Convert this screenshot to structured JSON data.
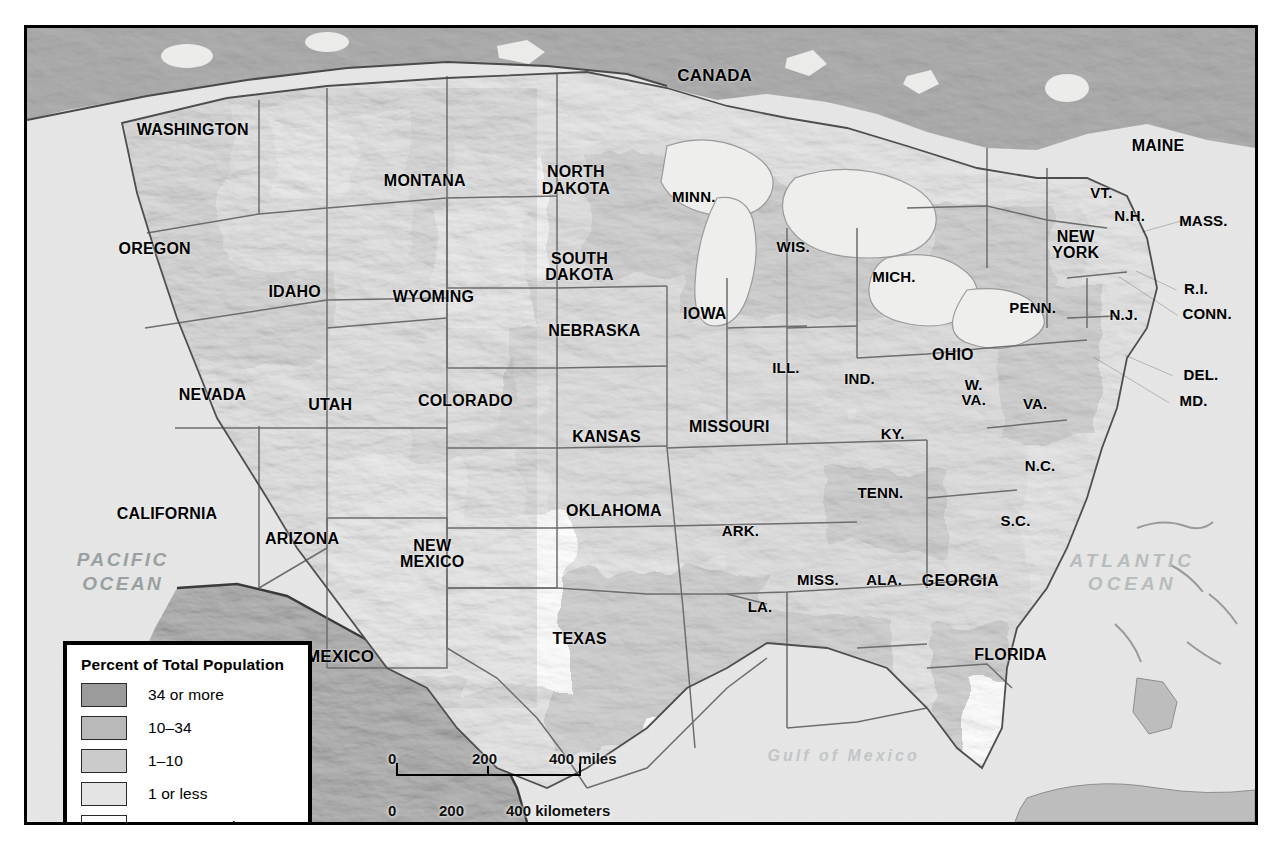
{
  "map": {
    "title": "Percent of Total Population",
    "countries": [
      {
        "name": "CANADA",
        "x": 56.0,
        "y": 6.0
      },
      {
        "name": "MEXICO",
        "x": 25.5,
        "y": 79.2
      }
    ],
    "water_labels": [
      {
        "name": "PACIFIC\nOCEAN",
        "x": 7.8,
        "y": 68.5,
        "style": "o-pac"
      },
      {
        "name": "ATLANTIC\nOCEAN",
        "x": 90.0,
        "y": 68.6,
        "style": "o-atl"
      },
      {
        "name": "Gulf of Mexico",
        "x": 66.5,
        "y": 91.7,
        "style": "o-gulf"
      }
    ],
    "states": [
      {
        "name": "WASHINGTON",
        "x": 13.5,
        "y": 12.9,
        "size": "med"
      },
      {
        "name": "OREGON",
        "x": 10.4,
        "y": 27.8,
        "size": "med"
      },
      {
        "name": "IDAHO",
        "x": 21.8,
        "y": 33.2,
        "size": "med"
      },
      {
        "name": "MONTANA",
        "x": 32.4,
        "y": 19.3,
        "size": "med"
      },
      {
        "name": "NORTH\nDAKOTA",
        "x": 44.7,
        "y": 19.2,
        "size": "med"
      },
      {
        "name": "SOUTH\nDAKOTA",
        "x": 45.0,
        "y": 30.1,
        "size": "med"
      },
      {
        "name": "WYOMING",
        "x": 33.1,
        "y": 33.9,
        "size": "med"
      },
      {
        "name": "NEBRASKA",
        "x": 46.2,
        "y": 38.1,
        "size": "med"
      },
      {
        "name": "NEVADA",
        "x": 15.1,
        "y": 46.2,
        "size": "med"
      },
      {
        "name": "UTAH",
        "x": 24.7,
        "y": 47.5,
        "size": "med"
      },
      {
        "name": "COLORADO",
        "x": 35.7,
        "y": 47.0,
        "size": "med"
      },
      {
        "name": "KANSAS",
        "x": 47.2,
        "y": 51.5,
        "size": "med"
      },
      {
        "name": "CALIFORNIA",
        "x": 11.4,
        "y": 61.2,
        "size": "med"
      },
      {
        "name": "ARIZONA",
        "x": 22.4,
        "y": 64.4,
        "size": "med"
      },
      {
        "name": "NEW\nMEXICO",
        "x": 33.0,
        "y": 66.2,
        "size": "med"
      },
      {
        "name": "OKLAHOMA",
        "x": 47.8,
        "y": 60.8,
        "size": "med"
      },
      {
        "name": "TEXAS",
        "x": 45.0,
        "y": 77.0,
        "size": "med"
      },
      {
        "name": "MINN.",
        "x": 54.3,
        "y": 21.3,
        "size": "sm"
      },
      {
        "name": "IOWA",
        "x": 55.2,
        "y": 36.0,
        "size": "med"
      },
      {
        "name": "MISSOURI",
        "x": 57.2,
        "y": 50.3,
        "size": "med"
      },
      {
        "name": "ARK.",
        "x": 58.1,
        "y": 63.4,
        "size": "sm"
      },
      {
        "name": "LA.",
        "x": 59.7,
        "y": 72.9,
        "size": "sm"
      },
      {
        "name": "WIS.",
        "x": 62.4,
        "y": 27.6,
        "size": "sm"
      },
      {
        "name": "ILL.",
        "x": 61.8,
        "y": 42.8,
        "size": "sm"
      },
      {
        "name": "MISS.",
        "x": 64.4,
        "y": 69.5,
        "size": "sm"
      },
      {
        "name": "MICH.",
        "x": 70.6,
        "y": 31.4,
        "size": "sm"
      },
      {
        "name": "IND.",
        "x": 67.8,
        "y": 44.2,
        "size": "sm"
      },
      {
        "name": "KY.",
        "x": 70.5,
        "y": 51.1,
        "size": "sm"
      },
      {
        "name": "TENN.",
        "x": 69.5,
        "y": 58.6,
        "size": "sm"
      },
      {
        "name": "ALA.",
        "x": 69.8,
        "y": 69.5,
        "size": "sm"
      },
      {
        "name": "OHIO",
        "x": 75.4,
        "y": 41.2,
        "size": "med"
      },
      {
        "name": "GEORGIA",
        "x": 76.0,
        "y": 69.6,
        "size": "med"
      },
      {
        "name": "FLORIDA",
        "x": 80.1,
        "y": 79.0,
        "size": "med"
      },
      {
        "name": "S.C.",
        "x": 80.5,
        "y": 62.1,
        "size": "sm"
      },
      {
        "name": "N.C.",
        "x": 82.5,
        "y": 55.2,
        "size": "sm"
      },
      {
        "name": "W.\nVA.",
        "x": 77.1,
        "y": 45.8,
        "size": "sm"
      },
      {
        "name": "VA.",
        "x": 82.1,
        "y": 47.3,
        "size": "sm"
      },
      {
        "name": "PENN.",
        "x": 81.9,
        "y": 35.3,
        "size": "sm"
      },
      {
        "name": "NEW\nYORK",
        "x": 85.4,
        "y": 27.3,
        "size": "med"
      },
      {
        "name": "VT.",
        "x": 87.5,
        "y": 20.8,
        "size": "sm"
      },
      {
        "name": "N.H.",
        "x": 89.8,
        "y": 23.7,
        "size": "sm"
      },
      {
        "name": "MAINE",
        "x": 92.1,
        "y": 14.9,
        "size": "med"
      },
      {
        "name": "N.J.",
        "x": 89.3,
        "y": 36.2,
        "size": "sm"
      }
    ],
    "callouts": [
      {
        "name": "MASS.",
        "x": 95.8,
        "y": 24.3,
        "line": [
          90.8,
          25.7,
          94.0,
          24.3
        ]
      },
      {
        "name": "R.I.",
        "x": 95.2,
        "y": 32.9,
        "line": [
          90.3,
          30.6,
          93.6,
          33.0
        ]
      },
      {
        "name": "CONN.",
        "x": 96.1,
        "y": 36.0,
        "line": [
          88.9,
          31.3,
          93.7,
          36.2
        ]
      },
      {
        "name": "DEL.",
        "x": 95.6,
        "y": 43.7,
        "line": [
          89.4,
          41.2,
          93.3,
          43.8
        ]
      },
      {
        "name": "MD.",
        "x": 95.0,
        "y": 47.0,
        "line": [
          86.9,
          41.5,
          93.0,
          47.2
        ]
      }
    ],
    "legend": {
      "title": "Percent of Total Population",
      "items": [
        {
          "label": "34 or more",
          "color": "#9b9b9b"
        },
        {
          "label": "10–34",
          "color": "#b9b9b9"
        },
        {
          "label": "1–10",
          "color": "#cbcbcb"
        },
        {
          "label": "1 or less",
          "color": "#e4e4e4"
        },
        {
          "label": "Not reported",
          "color": "#ffffff"
        }
      ]
    },
    "scale_bar": {
      "miles": {
        "ticks": [
          "0",
          "200",
          "400 miles"
        ],
        "unit": "miles"
      },
      "kilometers": {
        "ticks": [
          "0",
          "200",
          "400 kilometers"
        ],
        "unit": "kilometers"
      }
    }
  }
}
